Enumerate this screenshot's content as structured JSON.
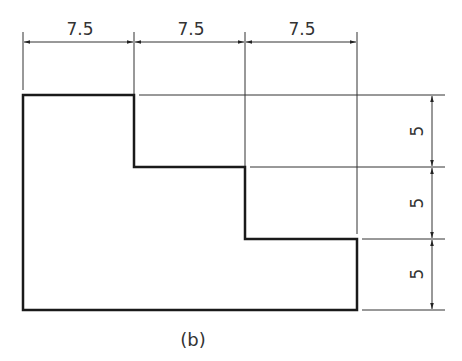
{
  "figure": {
    "caption": "(b)",
    "shape": "stepped profile (three steps)",
    "horizontal_dimensions": [
      "7.5",
      "7.5",
      "7.5"
    ],
    "vertical_dimensions": [
      "5",
      "5",
      "5"
    ],
    "colors": {
      "outline": "#1a1a1a",
      "dimension": "#333333",
      "background": "#ffffff"
    }
  }
}
